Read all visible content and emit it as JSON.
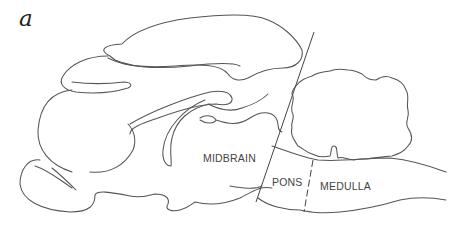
{
  "figure": {
    "panel_letter": "a",
    "labels": {
      "midbrain": "MIDBRAIN",
      "pons": "PONS",
      "medulla": "MEDULLA"
    },
    "line_color": "#555555",
    "background_color": "#ffffff"
  }
}
